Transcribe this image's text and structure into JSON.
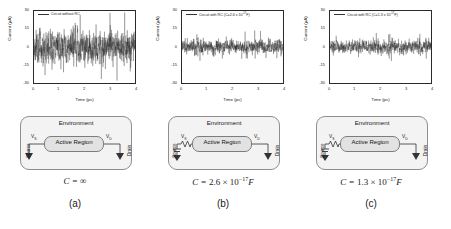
{
  "figure": {
    "panels": [
      {
        "id": "a",
        "letter": "(a)",
        "legend": "Circuit without RC",
        "legend_main": "Circuit without RC",
        "legend_exp": "",
        "legend_tail": "",
        "caption_lead": "C = ",
        "caption_value": "∞",
        "caption_exp": "",
        "caption_tail": "",
        "has_rc": false,
        "noise_amplitude": 1.0
      },
      {
        "id": "b",
        "letter": "(b)",
        "legend": "Circuit with RC (C=2.6 x 10-17F)",
        "legend_main": "Circuit with RC (C=2.6 x 10",
        "legend_exp": "-17",
        "legend_tail": "F)",
        "caption_lead": "C = ",
        "caption_value": "2.6 × 10",
        "caption_exp": "−17",
        "caption_tail": "F",
        "has_rc": true,
        "noise_amplitude": 0.42
      },
      {
        "id": "c",
        "letter": "(c)",
        "legend": "Circuit with RC (C=1.3 x 10-17F)",
        "legend_main": "Circuit with RC (C=1.3 x 10",
        "legend_exp": "-17",
        "legend_tail": "F)",
        "caption_lead": "C = ",
        "caption_value": "1.3 × 10",
        "caption_exp": "−17",
        "caption_tail": "F",
        "has_rc": true,
        "noise_amplitude": 0.4
      }
    ],
    "circuit": {
      "environment_label": "Environment",
      "active_region_label": "Active Region",
      "source_label": "Source",
      "drain_label": "Drain",
      "vs_label": "V",
      "vs_sub": "S",
      "vd_label": "V",
      "vd_sub": "D"
    }
  },
  "chart_data": {
    "type": "line",
    "title": "",
    "xlabel": "Time (ps)",
    "ylabel": "Current (µA)",
    "xlim": [
      0,
      4
    ],
    "ylim": [
      -30,
      30
    ],
    "xticks": [
      0,
      1,
      2,
      3,
      4
    ],
    "yticks": [
      30,
      15,
      0,
      -15,
      -30
    ],
    "xticklabels": [
      "0",
      "1",
      "2",
      "3",
      "4"
    ],
    "yticklabels": [
      "30",
      "15",
      "0",
      "-15",
      "-30"
    ],
    "grid": false,
    "legend_position": "top-left",
    "series": [
      {
        "name": "Circuit without RC",
        "panel": "a",
        "description": "Broadband thermal/shot current noise, no RC filtering",
        "rms_amplitude": 9.0,
        "peak_amplitude": 29.0,
        "mean": 0.0,
        "seed": 11
      },
      {
        "name": "Circuit with RC (C=2.6 x 10-17F)",
        "panel": "b",
        "description": "Current noise filtered by RC network, C = 2.6e-17 F",
        "rms_amplitude": 3.9,
        "peak_amplitude": 14.0,
        "mean": 0.0,
        "seed": 27
      },
      {
        "name": "Circuit with RC (C=1.3 x 10-17F)",
        "panel": "c",
        "description": "Current noise filtered by RC network, C = 1.3e-17 F",
        "rms_amplitude": 3.7,
        "peak_amplitude": 13.5,
        "mean": 0.0,
        "seed": 43
      }
    ]
  }
}
